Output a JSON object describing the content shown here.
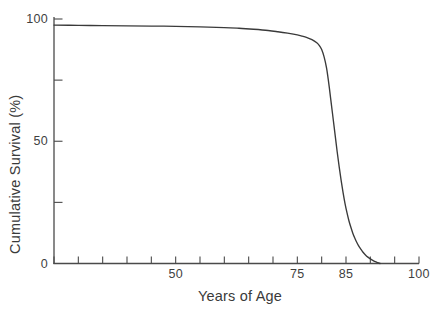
{
  "chart_data": {
    "type": "line",
    "title": "",
    "xlabel": "Years of Age",
    "ylabel": "Cumulative Survival (%)",
    "xlim": [
      25,
      100
    ],
    "ylim": [
      0,
      100
    ],
    "grid": false,
    "legend": null,
    "x_tick_labels": [
      {
        "value": 50,
        "label": "50"
      },
      {
        "value": 75,
        "label": "75"
      },
      {
        "value": 85,
        "label": "85"
      },
      {
        "value": 100,
        "label": "100"
      }
    ],
    "x_tick_values": [
      25,
      30,
      35,
      40,
      45,
      50,
      55,
      60,
      65,
      70,
      75,
      80,
      85,
      90,
      95,
      100
    ],
    "y_tick_labels": [
      {
        "value": 100,
        "label": "100"
      },
      {
        "value": 50,
        "label": "50"
      },
      {
        "value": 0,
        "label": "0"
      }
    ],
    "y_tick_values": [
      0,
      25,
      50,
      75,
      100
    ],
    "series": [
      {
        "name": "Cumulative Survival",
        "color": "#3a3a3a",
        "x": [
          25,
          30,
          35,
          40,
          45,
          50,
          55,
          60,
          63,
          66,
          69,
          71,
          73,
          75,
          76,
          77,
          78,
          79,
          79.5,
          80,
          80.5,
          81,
          81.3,
          81.6,
          82,
          82.4,
          82.8,
          83.2,
          83.6,
          84,
          84.4,
          84.8,
          85.2,
          85.6,
          86,
          86.4,
          86.8,
          87.2,
          87.6,
          88,
          88.5,
          89,
          89.5,
          90,
          90.5,
          91,
          91.5,
          92
        ],
        "y": [
          97.5,
          97.4,
          97.3,
          97.2,
          97.1,
          97.0,
          96.8,
          96.5,
          96.2,
          95.8,
          95.3,
          94.8,
          94.2,
          93.5,
          93.0,
          92.4,
          91.6,
          90.3,
          89.2,
          87.5,
          84.5,
          80.0,
          76.0,
          71.5,
          65.0,
          58.5,
          52.0,
          45.5,
          39.5,
          34.0,
          29.0,
          24.5,
          20.8,
          17.5,
          14.8,
          12.4,
          10.4,
          8.7,
          7.2,
          6.0,
          4.6,
          3.5,
          2.6,
          1.9,
          1.3,
          0.8,
          0.4,
          0.0
        ]
      }
    ]
  },
  "axis": {
    "line_color": "#4a4a4a"
  }
}
